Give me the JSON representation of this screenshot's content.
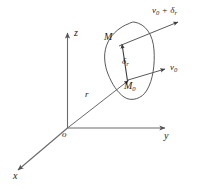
{
  "figure": {
    "kind": "vector-field-diagram",
    "background_color": "#ffffff",
    "stroke_color": "#555555",
    "text_color": "#1a1a1a",
    "axes": {
      "origin_label": "o",
      "z_label": "z",
      "y_label": "y",
      "x_label": "x"
    },
    "labels": {
      "position_vector": "r",
      "point_m": "M",
      "point_m0": "M",
      "point_m0_sub": "0",
      "delta_r": "δ",
      "delta_r_sub": "r",
      "velocity_v0": "v",
      "velocity_v0_sub": "0",
      "velocity_sum_v": "v",
      "velocity_sum_v_sub": "0",
      "velocity_sum_op": "+",
      "velocity_sum_delta": "δ",
      "velocity_sum_delta_sub": "r"
    }
  }
}
